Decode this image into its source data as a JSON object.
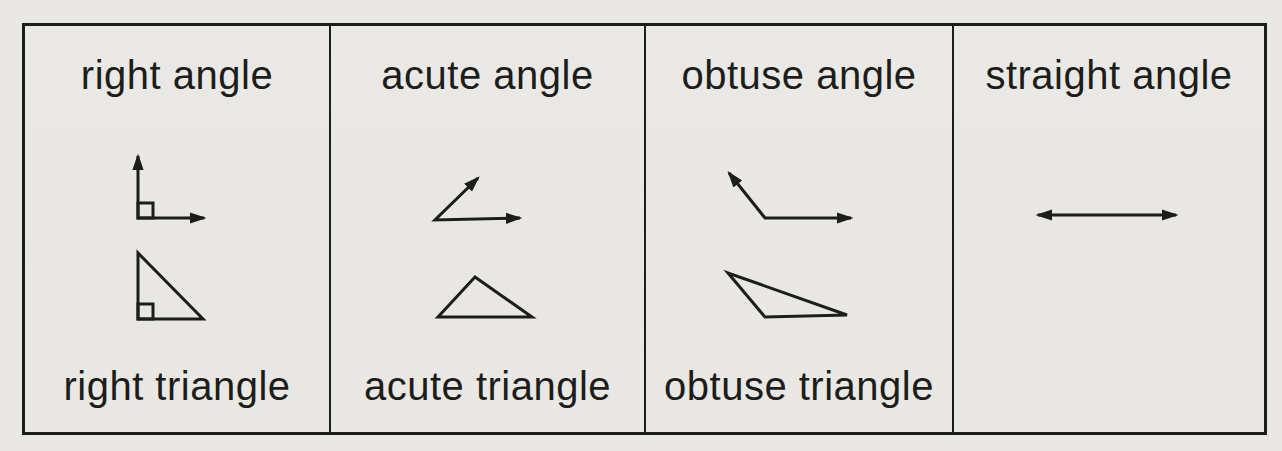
{
  "palette": {
    "paper": "#eae8e4",
    "ink": "#1d1d1b"
  },
  "table": {
    "cells": [
      {
        "angle_label": "right angle",
        "triangle_label": "right triangle"
      },
      {
        "angle_label": "acute angle",
        "triangle_label": "acute triangle"
      },
      {
        "angle_label": "obtuse angle",
        "triangle_label": "obtuse triangle"
      },
      {
        "angle_label": "straight angle",
        "triangle_label": ""
      }
    ]
  }
}
